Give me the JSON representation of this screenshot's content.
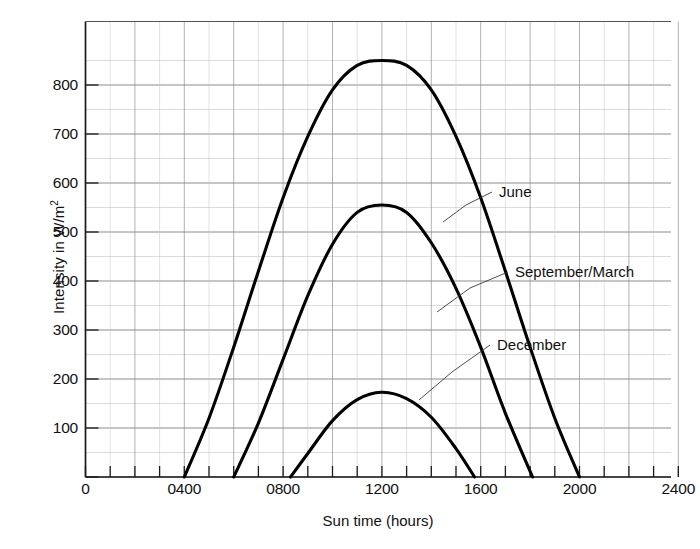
{
  "chart_data": {
    "type": "line",
    "title": "",
    "subtitle": "",
    "xlabel": "Sun time (hours)",
    "ylabel": "Intensity in W/m²",
    "ylabel_text": "Intensity in W/m",
    "ylabel_sup": "2",
    "xlim": [
      0,
      2400
    ],
    "ylim": [
      0,
      880
    ],
    "grid": true,
    "grid_x_minor_step": 100,
    "grid_x_major_step": 200,
    "grid_y_minor_step": 50,
    "grid_y_major_step": 50,
    "legend_position": "inline-annotations",
    "xticks": [
      0,
      400,
      800,
      1200,
      1600,
      2000,
      2400
    ],
    "xtick_labels": [
      "0",
      "0400",
      "0800",
      "1200",
      "1600",
      "2000",
      "2400"
    ],
    "yticks": [
      0,
      100,
      200,
      300,
      400,
      500,
      600,
      700,
      800
    ],
    "ytick_labels": [
      "0",
      "100",
      "200",
      "300",
      "400",
      "500",
      "600",
      "700",
      "800"
    ],
    "annotations": [
      {
        "name": "june",
        "text": "June",
        "x": 2020,
        "y": 620
      },
      {
        "name": "september-march",
        "text": "September/March",
        "x": 2020,
        "y": 425
      },
      {
        "name": "december",
        "text": "December",
        "x": 2020,
        "y": 292
      }
    ],
    "series": [
      {
        "name": "June",
        "label": "June",
        "peak_x": 1200,
        "peak_y": 850,
        "sunrise": 400,
        "sunset": 2000,
        "x": [
          400,
          500,
          600,
          700,
          800,
          900,
          1000,
          1100,
          1200,
          1300,
          1400,
          1500,
          1600,
          1700,
          1800,
          1900,
          2000
        ],
        "values": [
          0,
          120,
          265,
          420,
          570,
          695,
          790,
          840,
          850,
          840,
          790,
          695,
          570,
          420,
          265,
          120,
          0
        ]
      },
      {
        "name": "September/March",
        "label": "September/March",
        "peak_x": 1200,
        "peak_y": 555,
        "sunrise": 600,
        "sunset": 1810,
        "x": [
          600,
          700,
          800,
          900,
          1000,
          1100,
          1200,
          1300,
          1400,
          1500,
          1600,
          1700,
          1810
        ],
        "values": [
          0,
          110,
          240,
          370,
          475,
          540,
          555,
          540,
          478,
          385,
          265,
          130,
          0
        ]
      },
      {
        "name": "December",
        "label": "December",
        "peak_x": 1200,
        "peak_y": 173,
        "sunrise": 830,
        "sunset": 1575,
        "x": [
          830,
          900,
          1000,
          1100,
          1200,
          1300,
          1400,
          1500,
          1575
        ],
        "values": [
          0,
          48,
          115,
          158,
          173,
          160,
          122,
          58,
          0
        ]
      }
    ]
  },
  "axes": {
    "y_title_text": "Intensity in W/m",
    "y_title_sup": "2",
    "x_title": "Sun time (hours)"
  }
}
